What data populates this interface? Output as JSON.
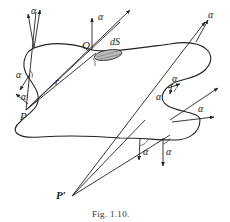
{
  "figure": {
    "caption": "Fig. 1.10.",
    "labels": {
      "alpha": "α",
      "Q": "Q",
      "dS": "dS",
      "r": "r",
      "P": "P",
      "P_prime": "P′"
    },
    "colors": {
      "ink": "#222222",
      "background": "#ffffff"
    }
  }
}
